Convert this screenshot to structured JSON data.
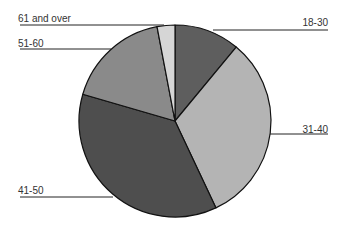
{
  "chart_data": {
    "type": "pie",
    "title": "",
    "center": [
      175,
      121
    ],
    "radius": 96,
    "start_angle_deg": 0,
    "direction": "clockwise",
    "slices": [
      {
        "label": "18-30",
        "value": 11.0,
        "color": "#5e5e5e"
      },
      {
        "label": "31-40",
        "value": 32.0,
        "color": "#b4b4b4"
      },
      {
        "label": "41-50",
        "value": 36.5,
        "color": "#4e4e4e"
      },
      {
        "label": "51-60",
        "value": 17.5,
        "color": "#8a8a8a"
      },
      {
        "label": "61 and over",
        "value": 3.0,
        "color": "#d6d6d6"
      }
    ],
    "legend": "none",
    "leader_labels": [
      {
        "label": "18-30",
        "text_x": 305,
        "text_y": 17,
        "line": [
          [
            213,
            30
          ],
          [
            328,
            30
          ]
        ],
        "align": "right"
      },
      {
        "label": "31-40",
        "text_x": 305,
        "text_y": 124,
        "line": [
          [
            270,
            134
          ],
          [
            328,
            134
          ]
        ],
        "align": "right"
      },
      {
        "label": "41-50",
        "text_x": 18,
        "text_y": 185,
        "line": [
          [
            20,
            197
          ],
          [
            113,
            197
          ]
        ],
        "align": "left"
      },
      {
        "label": "51-60",
        "text_x": 18,
        "text_y": 38,
        "line": [
          [
            20,
            49
          ],
          [
            111,
            49
          ]
        ],
        "align": "left"
      },
      {
        "label": "61 and over",
        "text_x": 18,
        "text_y": 13,
        "line": [
          [
            20,
            25
          ],
          [
            164,
            25
          ]
        ],
        "align": "left"
      }
    ]
  }
}
